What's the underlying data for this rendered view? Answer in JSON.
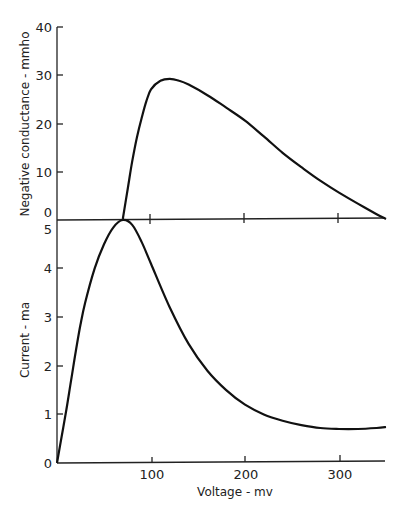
{
  "chart_data": [
    {
      "type": "line",
      "panel": "upper",
      "title": "",
      "xlabel": "Voltage - mv",
      "ylabel": "Negative conductance - mmho",
      "xlim": [
        0,
        350
      ],
      "ylim": [
        0,
        40
      ],
      "yticks": [
        0,
        10,
        20,
        30,
        40
      ],
      "xticks": [
        100,
        200,
        300
      ],
      "grid": false,
      "series": [
        {
          "name": "Negative conductance",
          "x": [
            70,
            75,
            80,
            85,
            90,
            95,
            100,
            110,
            120,
            130,
            140,
            160,
            180,
            200,
            220,
            240,
            260,
            280,
            300,
            320,
            340,
            350
          ],
          "y": [
            0,
            6,
            12,
            17,
            21,
            24.5,
            27,
            28.8,
            29.2,
            28.8,
            28,
            25.8,
            23.2,
            20.5,
            17.2,
            13.8,
            10.8,
            8,
            5.5,
            3.2,
            1,
            0
          ]
        }
      ]
    },
    {
      "type": "line",
      "panel": "lower",
      "title": "",
      "xlabel": "Voltage - mv",
      "ylabel": "Current - ma",
      "xlim": [
        0,
        350
      ],
      "ylim": [
        0,
        5
      ],
      "yticks": [
        0,
        1,
        2,
        3,
        4,
        5
      ],
      "xticks": [
        100,
        200,
        300
      ],
      "grid": false,
      "series": [
        {
          "name": "Current",
          "x": [
            0,
            5,
            10,
            15,
            20,
            25,
            30,
            40,
            50,
            60,
            70,
            80,
            90,
            100,
            120,
            140,
            160,
            180,
            200,
            220,
            240,
            260,
            280,
            300,
            320,
            340,
            350
          ],
          "y": [
            0,
            0.55,
            1.1,
            1.7,
            2.3,
            2.85,
            3.3,
            4.0,
            4.5,
            4.85,
            5.0,
            4.9,
            4.55,
            4.1,
            3.2,
            2.45,
            1.9,
            1.5,
            1.2,
            1.0,
            0.87,
            0.78,
            0.72,
            0.7,
            0.7,
            0.72,
            0.74
          ]
        }
      ]
    }
  ],
  "upper": {
    "ylabel": "Negative conductance - mmho",
    "yticks": [
      "40",
      "30",
      "20",
      "10",
      "0"
    ]
  },
  "lower": {
    "ylabel": "Current - ma",
    "yticks": [
      "5",
      "4",
      "3",
      "2",
      "1",
      "0"
    ],
    "xticks": [
      "100",
      "200",
      "300"
    ],
    "xlabel": "Voltage - mv"
  }
}
